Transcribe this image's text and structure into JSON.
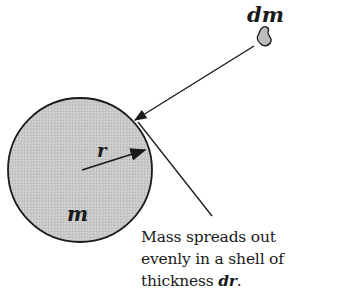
{
  "diagram": {
    "labels": {
      "mass_element": "dm",
      "radius": "r",
      "mass": "m"
    },
    "caption": {
      "line1": "Mass spreads out",
      "line2": "evenly in a shell of",
      "line3_prefix": "thickness ",
      "line3_var": "dr",
      "line3_suffix": "."
    },
    "colors": {
      "sphere_fill": "#c8c8c8",
      "stroke": "#1a1a1a",
      "background": "#ffffff"
    }
  }
}
